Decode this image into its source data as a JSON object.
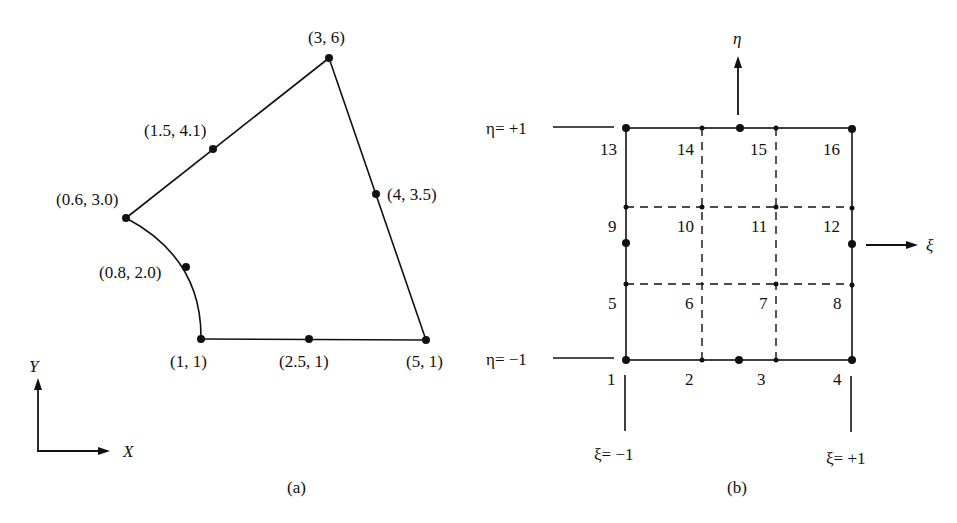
{
  "figure_a": {
    "caption": "(a)",
    "axes": {
      "x_label": "X",
      "y_label": "Y"
    },
    "nodes": [
      {
        "id": "p1",
        "label": "(1, 1)",
        "x": 1,
        "y": 1
      },
      {
        "id": "p2",
        "label": "(2.5, 1)",
        "x": 2.5,
        "y": 1
      },
      {
        "id": "p3",
        "label": "(5, 1)",
        "x": 5,
        "y": 1
      },
      {
        "id": "p4",
        "label": "(4, 3.5)",
        "x": 4,
        "y": 3.5
      },
      {
        "id": "p5",
        "label": "(3, 6)",
        "x": 3,
        "y": 6
      },
      {
        "id": "p6",
        "label": "(1.5, 4.1)",
        "x": 1.5,
        "y": 4.1
      },
      {
        "id": "p7",
        "label": "(0.6, 3.0)",
        "x": 0.6,
        "y": 3.0
      },
      {
        "id": "p8",
        "label": "(0.8, 2.0)",
        "x": 0.8,
        "y": 2.0
      }
    ],
    "edges": [
      {
        "from": "(1, 1)",
        "to": "(5, 1)",
        "type": "straight"
      },
      {
        "from": "(5, 1)",
        "to": "(3, 6)",
        "type": "straight"
      },
      {
        "from": "(3, 6)",
        "to": "(0.6, 3.0)",
        "type": "straight"
      },
      {
        "from": "(0.6, 3.0)",
        "to": "(1, 1)",
        "type": "curved"
      }
    ]
  },
  "figure_b": {
    "caption": "(b)",
    "axes": {
      "xi_label": "ξ",
      "eta_label": "η"
    },
    "boundary_labels": {
      "eta_plus": "η= +1",
      "eta_minus": "η= −1",
      "xi_minus": "ξ= −1",
      "xi_plus": "ξ= +1"
    },
    "node_numbers": [
      "1",
      "2",
      "3",
      "4",
      "5",
      "6",
      "7",
      "8",
      "9",
      "10",
      "11",
      "12",
      "13",
      "14",
      "15",
      "16"
    ]
  }
}
